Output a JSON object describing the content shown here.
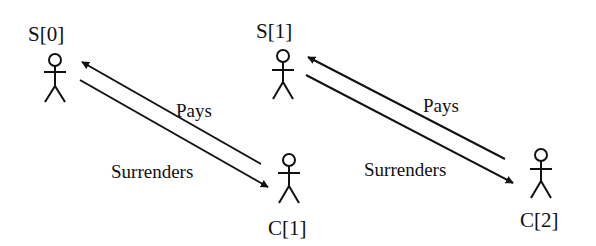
{
  "diagram": {
    "type": "use-case",
    "actors": [
      {
        "id": "s0",
        "label": "S[0]"
      },
      {
        "id": "s1",
        "label": "S[1]"
      },
      {
        "id": "c1",
        "label": "C[1]"
      },
      {
        "id": "c2",
        "label": "C[2]"
      }
    ],
    "edges": [
      {
        "from": "c1",
        "to": "s0",
        "label": "Pays"
      },
      {
        "from": "s0",
        "to": "c1",
        "label": "Surrenders"
      },
      {
        "from": "c2",
        "to": "s1",
        "label": "Pays"
      },
      {
        "from": "s1",
        "to": "c2",
        "label": "Surrenders"
      }
    ],
    "colors": {
      "stroke": "#111111",
      "background": "#ffffff"
    }
  }
}
